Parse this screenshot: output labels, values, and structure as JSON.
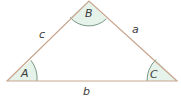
{
  "diagram": {
    "type": "triangle",
    "vertices": [
      {
        "id": "A",
        "label": "A",
        "x": 7,
        "y": 81
      },
      {
        "id": "B",
        "label": "B",
        "x": 89,
        "y": 1
      },
      {
        "id": "C",
        "label": "C",
        "x": 177,
        "y": 81
      }
    ],
    "sides": [
      {
        "id": "a",
        "label": "a",
        "between": [
          "B",
          "C"
        ]
      },
      {
        "id": "b",
        "label": "b",
        "between": [
          "A",
          "C"
        ]
      },
      {
        "id": "c",
        "label": "c",
        "between": [
          "A",
          "B"
        ]
      }
    ],
    "colors": {
      "edge": "#c8a58e",
      "angle_fill": "#e6f3ea",
      "angle_arc": "#7a9a86",
      "label": "#3a3a3a"
    }
  }
}
